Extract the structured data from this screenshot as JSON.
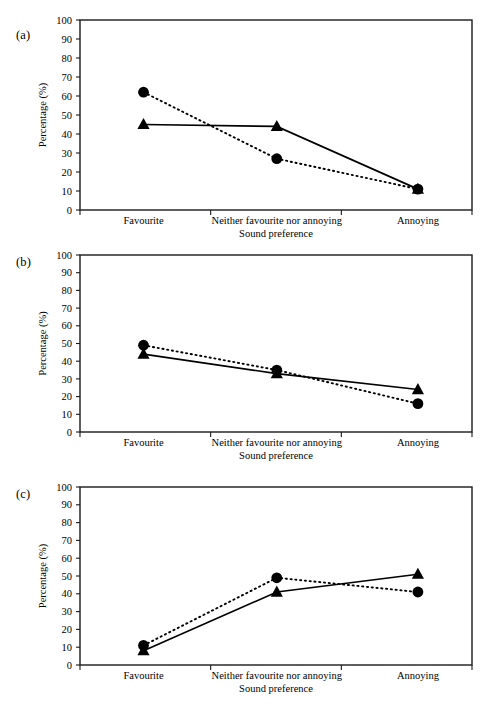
{
  "figure": {
    "panels": [
      {
        "tag": "(a)",
        "xlabel": "Sound preference",
        "ylabel": "Percentage (%)"
      },
      {
        "tag": "(b)",
        "xlabel": "Sound preference",
        "ylabel": "Percentage (%)"
      },
      {
        "tag": "(c)",
        "xlabel": "Sound preference",
        "ylabel": "Percentage (%)"
      }
    ]
  },
  "chart_data": [
    {
      "type": "line",
      "panel": "(a)",
      "title": "",
      "xlabel": "Sound preference",
      "ylabel": "Percentage (%)",
      "categories": [
        "Favourite",
        "Neither favourite nor annoying",
        "Annoying"
      ],
      "ylim": [
        0,
        100
      ],
      "yticks": [
        0,
        10,
        20,
        30,
        40,
        50,
        60,
        70,
        80,
        90,
        100
      ],
      "grid": false,
      "legend": "none",
      "series": [
        {
          "name": "circle-dotted",
          "marker": "circle",
          "linestyle": "dotted",
          "values": [
            62,
            27,
            11
          ]
        },
        {
          "name": "triangle-solid",
          "marker": "triangle",
          "linestyle": "solid",
          "values": [
            45,
            44,
            11
          ]
        }
      ]
    },
    {
      "type": "line",
      "panel": "(b)",
      "title": "",
      "xlabel": "Sound preference",
      "ylabel": "Percentage (%)",
      "categories": [
        "Favourite",
        "Neither favourite nor annoying",
        "Annoying"
      ],
      "ylim": [
        0,
        100
      ],
      "yticks": [
        0,
        10,
        20,
        30,
        40,
        50,
        60,
        70,
        80,
        90,
        100
      ],
      "grid": false,
      "legend": "none",
      "series": [
        {
          "name": "circle-dotted",
          "marker": "circle",
          "linestyle": "dotted",
          "values": [
            49,
            35,
            16
          ]
        },
        {
          "name": "triangle-solid",
          "marker": "triangle",
          "linestyle": "solid",
          "values": [
            44,
            33,
            24
          ]
        }
      ]
    },
    {
      "type": "line",
      "panel": "(c)",
      "title": "",
      "xlabel": "Sound preference",
      "ylabel": "Percentage (%)",
      "categories": [
        "Favourite",
        "Neither favourite nor annoying",
        "Annoying"
      ],
      "ylim": [
        0,
        100
      ],
      "yticks": [
        0,
        10,
        20,
        30,
        40,
        50,
        60,
        70,
        80,
        90,
        100
      ],
      "grid": false,
      "legend": "none",
      "series": [
        {
          "name": "circle-dotted",
          "marker": "circle",
          "linestyle": "dotted",
          "values": [
            11,
            49,
            41
          ]
        },
        {
          "name": "triangle-solid",
          "marker": "triangle",
          "linestyle": "solid",
          "values": [
            8,
            41,
            51
          ]
        }
      ]
    }
  ],
  "colors": {
    "ink": "#000000",
    "frame": "#1a1a1a",
    "background": "#ffffff"
  }
}
